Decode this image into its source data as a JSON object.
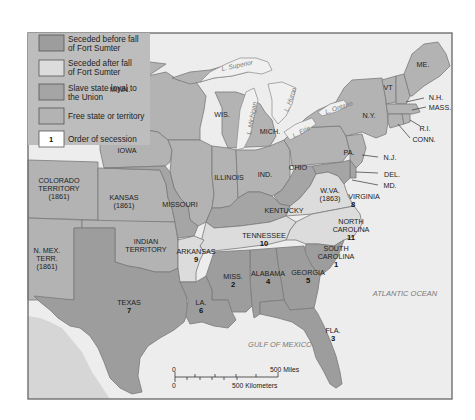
{
  "colors": {
    "seceded_before": "#9d9d9d",
    "seceded_after": "#dcdcdc",
    "slave_loyal": "#a5a5a5",
    "free": "#b3b3b3",
    "water": "#ededed",
    "order_box": "#ffffff"
  },
  "legend": {
    "items": [
      {
        "key": "seceded_before",
        "line1": "Seceded before fall",
        "line2": "of Fort Sumter"
      },
      {
        "key": "seceded_after",
        "line1": "Seceded after fall",
        "line2": "of Fort Sumter"
      },
      {
        "key": "slave_loyal",
        "line1": "Slave state loyal to",
        "line2": "the Union"
      },
      {
        "key": "free",
        "line1": "Free state or territory",
        "line2": ""
      },
      {
        "key": "order",
        "swatch_text": "1",
        "line1": "Order of secession",
        "line2": ""
      }
    ]
  },
  "states": {
    "minn": {
      "name": "MINN.",
      "status": "free"
    },
    "wis": {
      "name": "WIS.",
      "status": "free"
    },
    "mich": {
      "name": "MICH.",
      "status": "free"
    },
    "iowa": {
      "name": "IOWA",
      "status": "free"
    },
    "illinois": {
      "name": "ILLINOIS",
      "status": "free"
    },
    "ind": {
      "name": "IND.",
      "status": "free"
    },
    "ohio": {
      "name": "OHIO",
      "status": "free"
    },
    "pa": {
      "name": "PA.",
      "status": "free"
    },
    "ny": {
      "name": "N.Y.",
      "status": "free"
    },
    "vt": {
      "name": "VT",
      "status": "free"
    },
    "nh": {
      "name": "N.H.",
      "status": "free"
    },
    "me": {
      "name": "ME.",
      "status": "free"
    },
    "mass": {
      "name": "MASS.",
      "status": "free"
    },
    "ri": {
      "name": "R.I.",
      "status": "free"
    },
    "conn": {
      "name": "CONN.",
      "status": "free"
    },
    "nj": {
      "name": "N.J.",
      "status": "free"
    },
    "del": {
      "name": "DEL.",
      "status": "slave_loyal"
    },
    "md": {
      "name": "MD.",
      "status": "slave_loyal"
    },
    "wva": {
      "name": "W.VA.",
      "sub": "(1863)",
      "status": "slave_loyal"
    },
    "kentucky": {
      "name": "KENTUCKY",
      "status": "slave_loyal"
    },
    "missouri": {
      "name": "MISSOURI",
      "status": "slave_loyal"
    },
    "kansas": {
      "name": "KANSAS",
      "sub": "(1861)",
      "status": "free"
    },
    "colorado": {
      "name": "COLORADO",
      "name2": "TERRITORY",
      "sub": "(1861)",
      "status": "free"
    },
    "nmex": {
      "name": "N. MEX.",
      "name2": "TERR.",
      "sub": "(1861)",
      "status": "free"
    },
    "indian": {
      "name": "INDIAN",
      "name2": "TERRITORY",
      "status": "free"
    },
    "virginia": {
      "name": "VIRGINIA",
      "order": "8",
      "status": "seceded_after"
    },
    "ncarolina": {
      "name": "NORTH",
      "name2": "CAROLINA",
      "order": "11",
      "status": "seceded_after"
    },
    "tennessee": {
      "name": "TENNESSEE",
      "order": "10",
      "status": "seceded_after"
    },
    "arkansas": {
      "name": "ARKANSAS",
      "order": "9",
      "status": "seceded_after"
    },
    "scarolina": {
      "name": "SOUTH",
      "name2": "CAROLINA",
      "order": "1",
      "status": "seceded_before"
    },
    "miss": {
      "name": "MISS.",
      "order": "2",
      "status": "seceded_before"
    },
    "fla": {
      "name": "FLA.",
      "order": "3",
      "status": "seceded_before"
    },
    "alabama": {
      "name": "ALABAMA",
      "order": "4",
      "status": "seceded_before"
    },
    "georgia": {
      "name": "GEORGIA",
      "order": "5",
      "status": "seceded_before"
    },
    "la": {
      "name": "LA.",
      "order": "6",
      "status": "seceded_before"
    },
    "texas": {
      "name": "TEXAS",
      "order": "7",
      "status": "seceded_before"
    }
  },
  "lakes": {
    "superior": "L. Superior",
    "michigan": "L. Michigan",
    "huron": "L. Huron",
    "erie": "L. Erie",
    "ontario": "L. Ontario"
  },
  "water_labels": {
    "atlantic": "ATLANTIC OCEAN",
    "gulf": "GULF OF MEXICO"
  },
  "scale": {
    "miles_zero": "0",
    "miles_label": "500 Miles",
    "km_zero": "0",
    "km_label": "500 Kilometers"
  }
}
